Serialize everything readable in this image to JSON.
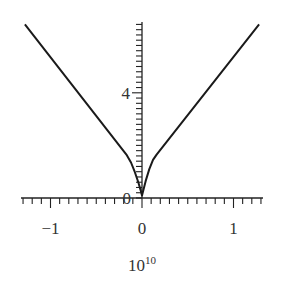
{
  "chart_data": {
    "type": "line",
    "title": "",
    "xlabel": "10^10",
    "xlabel_base": "10",
    "xlabel_exponent": "10",
    "ylabel": "",
    "xlim": [
      -1.33,
      1.33
    ],
    "ylim": [
      0,
      6.7
    ],
    "grid": false,
    "legend": null,
    "x_ticks": {
      "major": [
        -1,
        0,
        1
      ],
      "minor_step": 0.1,
      "labels": [
        "−1",
        "0",
        "1"
      ]
    },
    "y_ticks": {
      "major": [
        0,
        4
      ],
      "minor_step": 0.2,
      "labels": [
        "0",
        "4"
      ]
    },
    "series": [
      {
        "name": "curve",
        "color": "#1a1a1a",
        "x": [
          -1.28,
          -0.17,
          -0.12,
          -0.08,
          -0.04,
          -0.015,
          0,
          0.015,
          0.04,
          0.08,
          0.12,
          0.16,
          1.28
        ],
        "y": [
          6.6,
          1.65,
          1.35,
          1.0,
          0.6,
          0.3,
          0.1,
          0.3,
          0.65,
          1.1,
          1.45,
          1.65,
          6.6
        ]
      }
    ]
  },
  "axes": {
    "x_origin_label": "0",
    "y_origin_label": "0"
  }
}
